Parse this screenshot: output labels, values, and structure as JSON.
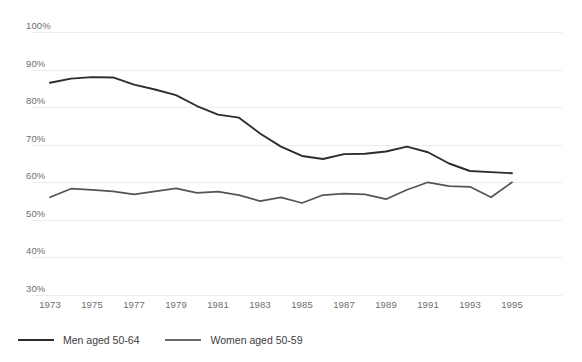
{
  "chart_data": {
    "type": "line",
    "title": "",
    "subtitle": "",
    "xlabel": "",
    "ylabel": "",
    "x": [
      1973,
      1974,
      1975,
      1976,
      1977,
      1978,
      1979,
      1980,
      1981,
      1982,
      1983,
      1984,
      1985,
      1986,
      1987,
      1988,
      1989,
      1990,
      1991,
      1992,
      1993,
      1994,
      1995
    ],
    "xlim": [
      1973,
      1995
    ],
    "ylim": [
      30,
      100
    ],
    "grid": true,
    "legend_position": "bottom-left",
    "ytick_labels": [
      "100%",
      "90%",
      "80%",
      "70%",
      "60%",
      "50%",
      "40%",
      "30%"
    ],
    "ytick_values": [
      100,
      90,
      80,
      70,
      60,
      50,
      40,
      30
    ],
    "xtick_labels": [
      "1973",
      "1975",
      "1977",
      "1979",
      "1981",
      "1983",
      "1985",
      "1987",
      "1989",
      "1991",
      "1993",
      "1995"
    ],
    "xtick_values": [
      1973,
      1975,
      1977,
      1979,
      1981,
      1983,
      1985,
      1987,
      1989,
      1991,
      1993,
      1995
    ],
    "series": [
      {
        "name": "Men aged 50-64",
        "color": "#2d2d2d",
        "values": [
          86.5,
          87.6,
          88.0,
          87.9,
          86.0,
          84.7,
          83.2,
          80.3,
          78.0,
          77.2,
          73.0,
          69.5,
          67.0,
          66.2,
          67.5,
          67.6,
          68.2,
          69.5,
          68.0,
          65.0,
          63.0,
          62.7,
          62.4
        ]
      },
      {
        "name": "Women aged 50-59",
        "color": "#555555",
        "values": [
          56.0,
          58.3,
          58.0,
          57.6,
          56.8,
          57.6,
          58.4,
          57.2,
          57.5,
          56.6,
          55.0,
          56.0,
          54.5,
          56.6,
          57.0,
          56.8,
          55.5,
          58.0,
          60.0,
          59.0,
          58.8,
          56.0,
          60.0
        ]
      }
    ]
  },
  "legend": {
    "items": [
      {
        "label": "Men aged 50-64"
      },
      {
        "label": "Women aged 50-59"
      }
    ]
  }
}
